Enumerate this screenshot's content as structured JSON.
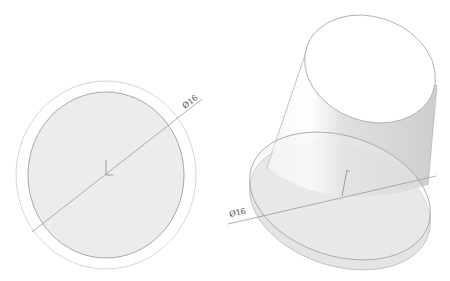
{
  "views": {
    "top_view": {
      "label": "Top view",
      "dimension": {
        "text": "Ø16"
      }
    },
    "iso_view": {
      "label": "Isometric view",
      "dimension": {
        "text": "Ø16"
      }
    }
  },
  "colors": {
    "background": "#ffffff",
    "face_fill": "#ececec",
    "face_stroke": "#a8a8a8",
    "outer_ring": "#d6d6d6",
    "dimension_line": "#9a9a9a",
    "cylinder_shade": "#d9d9d9"
  }
}
